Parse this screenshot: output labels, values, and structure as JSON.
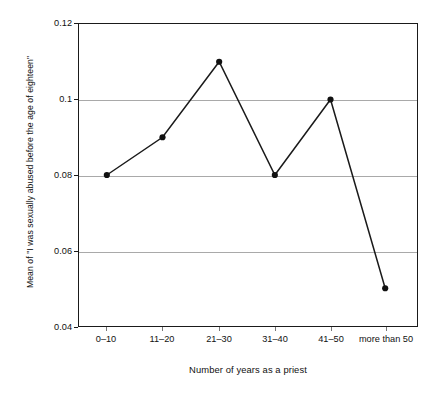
{
  "chart_data": {
    "type": "line",
    "title": "",
    "subtitle": "",
    "xlabel": "Number of years as a priest",
    "ylabel": "Mean of \"I was sexually abused before the age of eighteen\"",
    "categories": [
      "0–10",
      "11–20",
      "21–30",
      "31–40",
      "41–50",
      "more than 50"
    ],
    "values": [
      0.08,
      0.09,
      0.11,
      0.08,
      0.1,
      0.05
    ],
    "series": [
      {
        "name": "Mean of \"I was sexually abused before the age of eighteen\"",
        "values": [
          0.08,
          0.09,
          0.11,
          0.08,
          0.1,
          0.05
        ]
      }
    ],
    "ylim": [
      0.04,
      0.12
    ],
    "y_ticks": [
      0.12,
      0.1,
      0.08,
      0.06,
      0.04
    ],
    "y_tick_labels": [
      "0.12",
      "0.1",
      "0.08",
      "0.06",
      "0.04"
    ],
    "gridlines": {
      "horizontal": [
        0.06,
        0.08,
        0.1
      ],
      "vertical": []
    },
    "grid": true,
    "legend": null,
    "legend_position": "none",
    "marker": "filled-circle",
    "line_color": "#1a1a1a",
    "marker_color": "#111111",
    "grid_color": "#a9a9a9",
    "axis_color": "#1a1a1a",
    "background": "#ffffff",
    "annotations": []
  },
  "axes": {
    "y_tick_labels": [
      "0.12",
      "0.1",
      "0.08",
      "0.06",
      "0.04"
    ],
    "x_tick_labels": [
      "0–10",
      "11–20",
      "21–30",
      "31–40",
      "41–50",
      "more than 50"
    ],
    "x_title": "Number of years as a priest",
    "y_title": "Mean of \"I was sexually abused before the age of eighteen\""
  }
}
